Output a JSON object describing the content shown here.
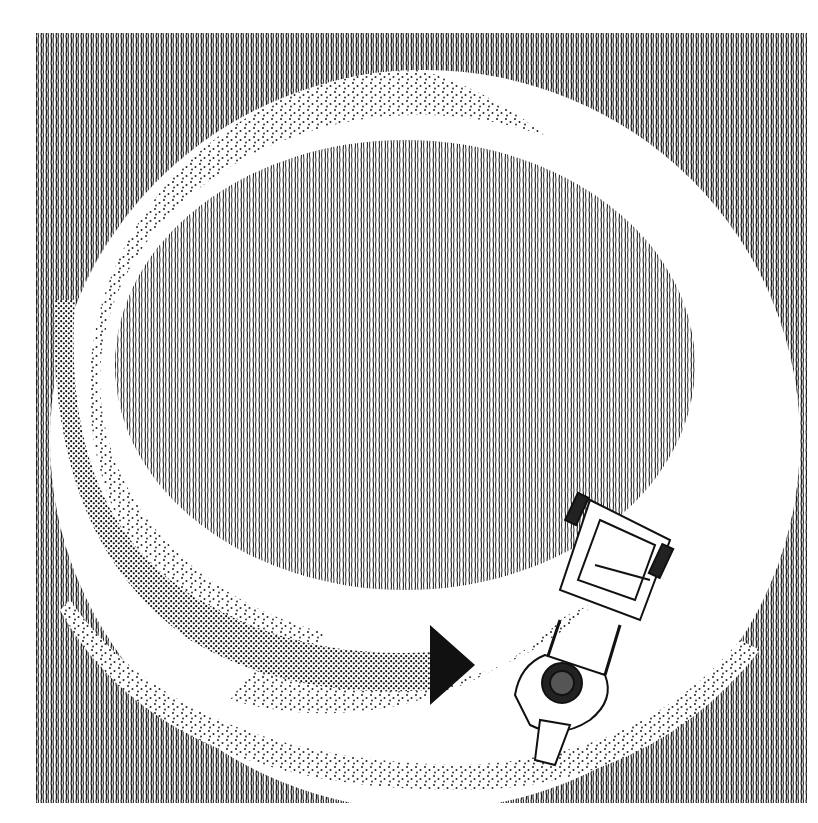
{
  "illustration": {
    "subject": "Top-down pen-and-ink drawing of a person pushing a lawn mower in a spiral path around a lawn",
    "style": "black-and-white hatching and stippling",
    "colors": {
      "background": "#ffffff",
      "ink": "#1a1a1a",
      "grass_uncut": "#3a3a3a",
      "arrow": "#111111"
    },
    "elements": [
      {
        "name": "outer-grass",
        "description": "Hatched uncut grass filling the square frame outside the spiral"
      },
      {
        "name": "mown-path-white",
        "description": "White mown strip spiraling around"
      },
      {
        "name": "stippled-path",
        "description": "Dotted strip showing freshly cut grass, darkening toward the arrow"
      },
      {
        "name": "inner-lawn",
        "description": "Central oval of uncut hatched grass"
      },
      {
        "name": "direction-arrow",
        "description": "Solid black arrow pointing right toward the mower"
      },
      {
        "name": "person-with-mower",
        "description": "Person seen from above pushing a mower along the spiral"
      }
    ]
  }
}
